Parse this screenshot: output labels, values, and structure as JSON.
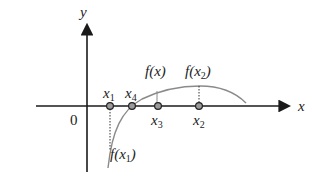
{
  "diagram": {
    "axes": {
      "x_label": "x",
      "y_label": "y",
      "origin_label": "0"
    },
    "points": [
      {
        "name": "x",
        "sub": "1",
        "px": 110
      },
      {
        "name": "x",
        "sub": "4",
        "px": 132
      },
      {
        "name": "x",
        "sub": "3",
        "px": 158
      },
      {
        "name": "x",
        "sub": "2",
        "px": 199
      }
    ],
    "curve_label": "f(x)",
    "annotations": {
      "f_x1": {
        "pre": "f(x",
        "sub": "1",
        "post": ")"
      },
      "f_x2": {
        "pre": "f(x",
        "sub": "2",
        "post": ")"
      }
    },
    "colors": {
      "axis": "#1a1a1a",
      "curve": "#8a8a8a",
      "point_fill": "#9a9a9a"
    }
  }
}
